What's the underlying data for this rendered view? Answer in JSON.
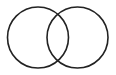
{
  "diagram": {
    "type": "venn",
    "background": "#ffffff",
    "stroke_color": "#222222",
    "stroke_width": 1.6,
    "circles": [
      {
        "name": "left-circle",
        "cx": 38,
        "cy": 37.5,
        "r": 30.5
      },
      {
        "name": "right-circle",
        "cx": 77.5,
        "cy": 37.5,
        "r": 30.5
      }
    ]
  }
}
